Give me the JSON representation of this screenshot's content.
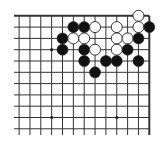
{
  "board": {
    "description": "Go board fragment, top-right corner",
    "visible_columns": 13,
    "visible_rows": 11,
    "line_color": "#333333",
    "background": "#ffffff",
    "origin_x": 149.3,
    "origin_y": 15.8,
    "col_spacing": 10.85,
    "row_spacing": 11.3,
    "left_extent": 14,
    "bottom_extent": 135,
    "star_points": [
      {
        "col": 9,
        "row": 3
      },
      {
        "col": 3,
        "row": 9
      },
      {
        "col": 9,
        "row": 9
      }
    ],
    "stones": [
      {
        "color": "white",
        "col": 1,
        "row": 0
      },
      {
        "color": "black",
        "col": 7,
        "row": 1
      },
      {
        "color": "black",
        "col": 6,
        "row": 1
      },
      {
        "color": "white",
        "col": 5,
        "row": 1
      },
      {
        "color": "white",
        "col": 3,
        "row": 1
      },
      {
        "color": "white",
        "col": 1,
        "row": 1
      },
      {
        "color": "black",
        "col": 0,
        "row": 1
      },
      {
        "color": "black",
        "col": 8,
        "row": 2
      },
      {
        "color": "white",
        "col": 7,
        "row": 2
      },
      {
        "color": "white",
        "col": 6,
        "row": 2
      },
      {
        "color": "white",
        "col": 3,
        "row": 2
      },
      {
        "color": "white",
        "col": 2,
        "row": 2
      },
      {
        "color": "black",
        "col": 1,
        "row": 2
      },
      {
        "color": "black",
        "col": 8,
        "row": 3
      },
      {
        "color": "black",
        "col": 6,
        "row": 3
      },
      {
        "color": "white",
        "col": 5,
        "row": 3
      },
      {
        "color": "white",
        "col": 3,
        "row": 3
      },
      {
        "color": "black",
        "col": 2,
        "row": 3
      },
      {
        "color": "black",
        "col": 6,
        "row": 4
      },
      {
        "color": "black",
        "col": 4,
        "row": 4
      },
      {
        "color": "black",
        "col": 3,
        "row": 4
      },
      {
        "color": "black",
        "col": 1,
        "row": 4
      },
      {
        "color": "black",
        "col": 5,
        "row": 5
      }
    ]
  }
}
